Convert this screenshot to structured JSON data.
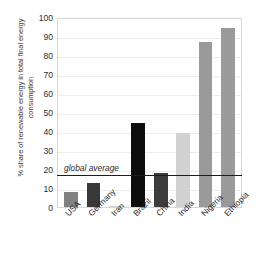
{
  "chart_data": {
    "type": "bar",
    "title": "",
    "xlabel": "",
    "ylabel": "% share of renewable energy in total final energy consumption",
    "categories": [
      "USA",
      "Germany",
      "Iran",
      "Brazil",
      "China",
      "India",
      "Nigeria",
      "Ethiopia"
    ],
    "values": [
      8,
      12.5,
      0.5,
      44,
      18,
      39,
      87,
      94
    ],
    "bar_colors": [
      "#808080",
      "#383838",
      "#cccccc",
      "#0d0d0d",
      "#3c3c3c",
      "#d2d2d2",
      "#9a9a9a",
      "#9a9a9a"
    ],
    "ylim": [
      0,
      100
    ],
    "ytick_step": 10,
    "yticks": [
      "0",
      "10",
      "20",
      "30",
      "40",
      "50",
      "60",
      "70",
      "80",
      "90",
      "100"
    ],
    "grid": true,
    "legend": "none",
    "annotations": [
      {
        "text": "global average",
        "value": 18,
        "style": "italic",
        "line": true,
        "line_color": "#1c1c1c"
      }
    ]
  }
}
